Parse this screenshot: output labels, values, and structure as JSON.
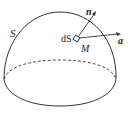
{
  "diagram": {
    "title": "",
    "surface_label": "S",
    "element_label": "dS",
    "point_label": "M",
    "normal_vector_label": "n",
    "vector_label": "a",
    "colors": {
      "stroke": "#333333",
      "background": "#ffffff"
    }
  }
}
